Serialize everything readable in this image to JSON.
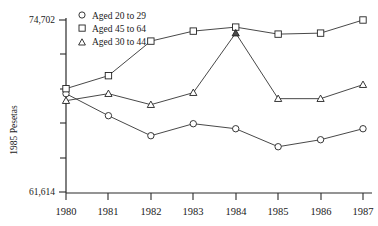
{
  "chart_data": {
    "type": "line",
    "title": "",
    "xlabel": "",
    "ylabel": "1985 Pesetas",
    "categories": [
      "1980",
      "1981",
      "1982",
      "1983",
      "1984",
      "1985",
      "1986",
      "1987"
    ],
    "x": [
      1980,
      1981,
      1982,
      1983,
      1984,
      1985,
      1986,
      1987
    ],
    "ylim": [
      61614,
      74702
    ],
    "y_tick_labels": [
      "61,614",
      "74,702"
    ],
    "y_axis_min_label": "61,614",
    "y_axis_max_label": "74,702",
    "grid": false,
    "legend_position": "top-center",
    "series": [
      {
        "name": "Aged 20 to 29",
        "marker": "circle",
        "values": [
          69096,
          67420,
          65897,
          66810,
          66429,
          65059,
          65592,
          66429
        ]
      },
      {
        "name": "Aged 45 to 64",
        "marker": "square",
        "values": [
          69477,
          70466,
          73096,
          73857,
          74161,
          73628,
          73704,
          74702
        ]
      },
      {
        "name": "Aged 30 to 44",
        "marker": "triangle",
        "values": [
          68563,
          69096,
          68259,
          69172,
          73704,
          68716,
          68716,
          69781
        ]
      }
    ]
  },
  "axis": {
    "y_title": "1985 Pesetas",
    "y_top_label": "74,702",
    "y_bottom_label": "61,614",
    "x_labels": [
      "1980",
      "1981",
      "1982",
      "1983",
      "1984",
      "1985",
      "1986",
      "1987"
    ]
  },
  "legend": {
    "items": [
      {
        "label": "Aged 20 to 29",
        "marker": "circle"
      },
      {
        "label": "Aged 45 to 64",
        "marker": "square"
      },
      {
        "label": "Aged 30 to 44",
        "marker": "triangle"
      }
    ]
  }
}
